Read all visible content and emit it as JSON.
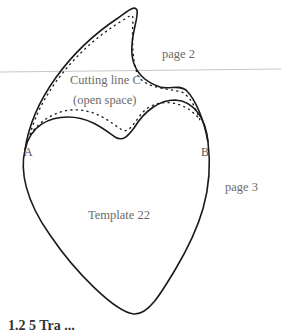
{
  "diagram": {
    "labels": {
      "page2": "page 2",
      "page3": "page 3",
      "cutting_line": "Cutting line C",
      "open_space": "(open space)",
      "point_a": "A",
      "point_b": "B",
      "template": "Template 22"
    },
    "caption": "1.2 5 Tra ...",
    "colors": {
      "outline": "#1a1a1a",
      "page_divider": "#c8c8c8",
      "label_text": "#6b6b6b"
    }
  }
}
